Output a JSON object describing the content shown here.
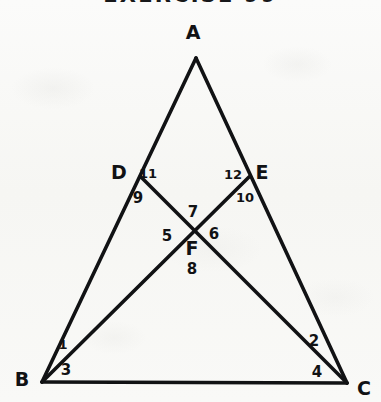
{
  "header": {
    "title": "EXERCISE 99",
    "title_clipped": true
  },
  "figure": {
    "kind": "geometry-diagram",
    "stroke_color": "#111214",
    "background_color": "#f8f8f6",
    "vertices": [
      {
        "id": "A",
        "label": "A",
        "point": [
          196,
          58
        ],
        "label_point": [
          193,
          32
        ]
      },
      {
        "id": "B",
        "label": "B",
        "point": [
          42,
          382
        ],
        "label_point": [
          22,
          379
        ]
      },
      {
        "id": "C",
        "label": "C",
        "point": [
          347,
          383
        ],
        "label_point": [
          364,
          388
        ]
      },
      {
        "id": "D",
        "label": "D",
        "point": [
          141,
          177
        ],
        "label_point": [
          119,
          172
        ]
      },
      {
        "id": "E",
        "label": "E",
        "point": [
          249,
          177
        ],
        "label_point": [
          262,
          172
        ]
      },
      {
        "id": "F",
        "label": "F",
        "point": [
          192,
          229
        ],
        "label_point": [
          192,
          248
        ]
      }
    ],
    "segments": [
      {
        "id": "AB",
        "from": "A",
        "to": "B",
        "width": 3.6
      },
      {
        "id": "AC",
        "from": "A",
        "to": "C",
        "width": 3.6
      },
      {
        "id": "BC",
        "from": "B",
        "to": "C",
        "width": 3.6
      },
      {
        "id": "DC",
        "from": "D",
        "to": "C",
        "width": 3.6
      },
      {
        "id": "EB",
        "from": "E",
        "to": "B",
        "width": 3.6
      }
    ],
    "angles": [
      {
        "n": "1",
        "at": "B",
        "label_point": [
          63,
          344
        ],
        "size": "thin"
      },
      {
        "n": "2",
        "at": "C",
        "label_point": [
          314,
          341
        ],
        "size": "normal"
      },
      {
        "n": "3",
        "at": "B",
        "label_point": [
          66,
          370
        ],
        "size": "normal"
      },
      {
        "n": "4",
        "at": "C",
        "label_point": [
          317,
          372
        ],
        "size": "normal"
      },
      {
        "n": "5",
        "at": "F",
        "label_point": [
          167,
          236
        ],
        "size": "normal"
      },
      {
        "n": "6",
        "at": "F",
        "label_point": [
          214,
          234
        ],
        "size": "normal"
      },
      {
        "n": "7",
        "at": "F",
        "label_point": [
          193,
          212
        ],
        "size": "normal"
      },
      {
        "n": "8",
        "at": "F",
        "label_point": [
          192,
          269
        ],
        "size": "normal"
      },
      {
        "n": "9",
        "at": "D",
        "label_point": [
          138,
          198
        ],
        "size": "normal"
      },
      {
        "n": "10",
        "at": "E",
        "label_point": [
          245,
          197
        ],
        "size": "small"
      },
      {
        "n": "11",
        "at": "D",
        "label_point": [
          148,
          173
        ],
        "size": "small"
      },
      {
        "n": "12",
        "at": "E",
        "label_point": [
          233,
          174
        ],
        "size": "small"
      }
    ]
  }
}
